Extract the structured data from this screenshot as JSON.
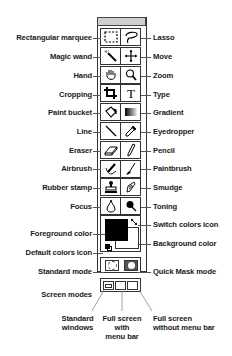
{
  "toolbox": {
    "title": "",
    "tools": [
      {
        "left": "Rectangular marquee",
        "right": "Lasso",
        "left_icon": "rectangular-marquee-icon",
        "right_icon": "lasso-icon"
      },
      {
        "left": "Magic wand",
        "right": "Move",
        "left_icon": "magic-wand-icon",
        "right_icon": "move-icon"
      },
      {
        "left": "Hand",
        "right": "Zoom",
        "left_icon": "hand-icon",
        "right_icon": "zoom-icon"
      },
      {
        "left": "Cropping",
        "right": "Type",
        "left_icon": "crop-icon",
        "right_icon": "type-icon"
      },
      {
        "left": "Paint bucket",
        "right": "Gradient",
        "left_icon": "paint-bucket-icon",
        "right_icon": "gradient-icon"
      },
      {
        "left": "Line",
        "right": "Eyedropper",
        "left_icon": "line-icon",
        "right_icon": "eyedropper-icon"
      },
      {
        "left": "Eraser",
        "right": "Pencil",
        "left_icon": "eraser-icon",
        "right_icon": "pencil-icon"
      },
      {
        "left": "Airbrush",
        "right": "Paintbrush",
        "left_icon": "airbrush-icon",
        "right_icon": "paintbrush-icon"
      },
      {
        "left": "Rubber stamp",
        "right": "Smudge",
        "left_icon": "rubber-stamp-icon",
        "right_icon": "smudge-icon"
      },
      {
        "left": "Focus",
        "right": "Toning",
        "left_icon": "focus-icon",
        "right_icon": "toning-icon"
      }
    ],
    "colors": {
      "foreground_label": "Foreground color",
      "background_label": "Background color",
      "switch_label": "Switch colors icon",
      "default_label": "Default colors icon",
      "foreground": "#000000",
      "background": "#ffffff"
    },
    "modes": {
      "standard_label": "Standard mode",
      "quickmask_label": "Quick Mask mode"
    },
    "screen_modes": {
      "label": "Screen modes",
      "standard": [
        "Standard",
        "windows"
      ],
      "full_with_menu": [
        "Full screen",
        "with",
        "menu bar"
      ],
      "full_without_menu": [
        "Full screen",
        "without menu bar"
      ]
    }
  }
}
